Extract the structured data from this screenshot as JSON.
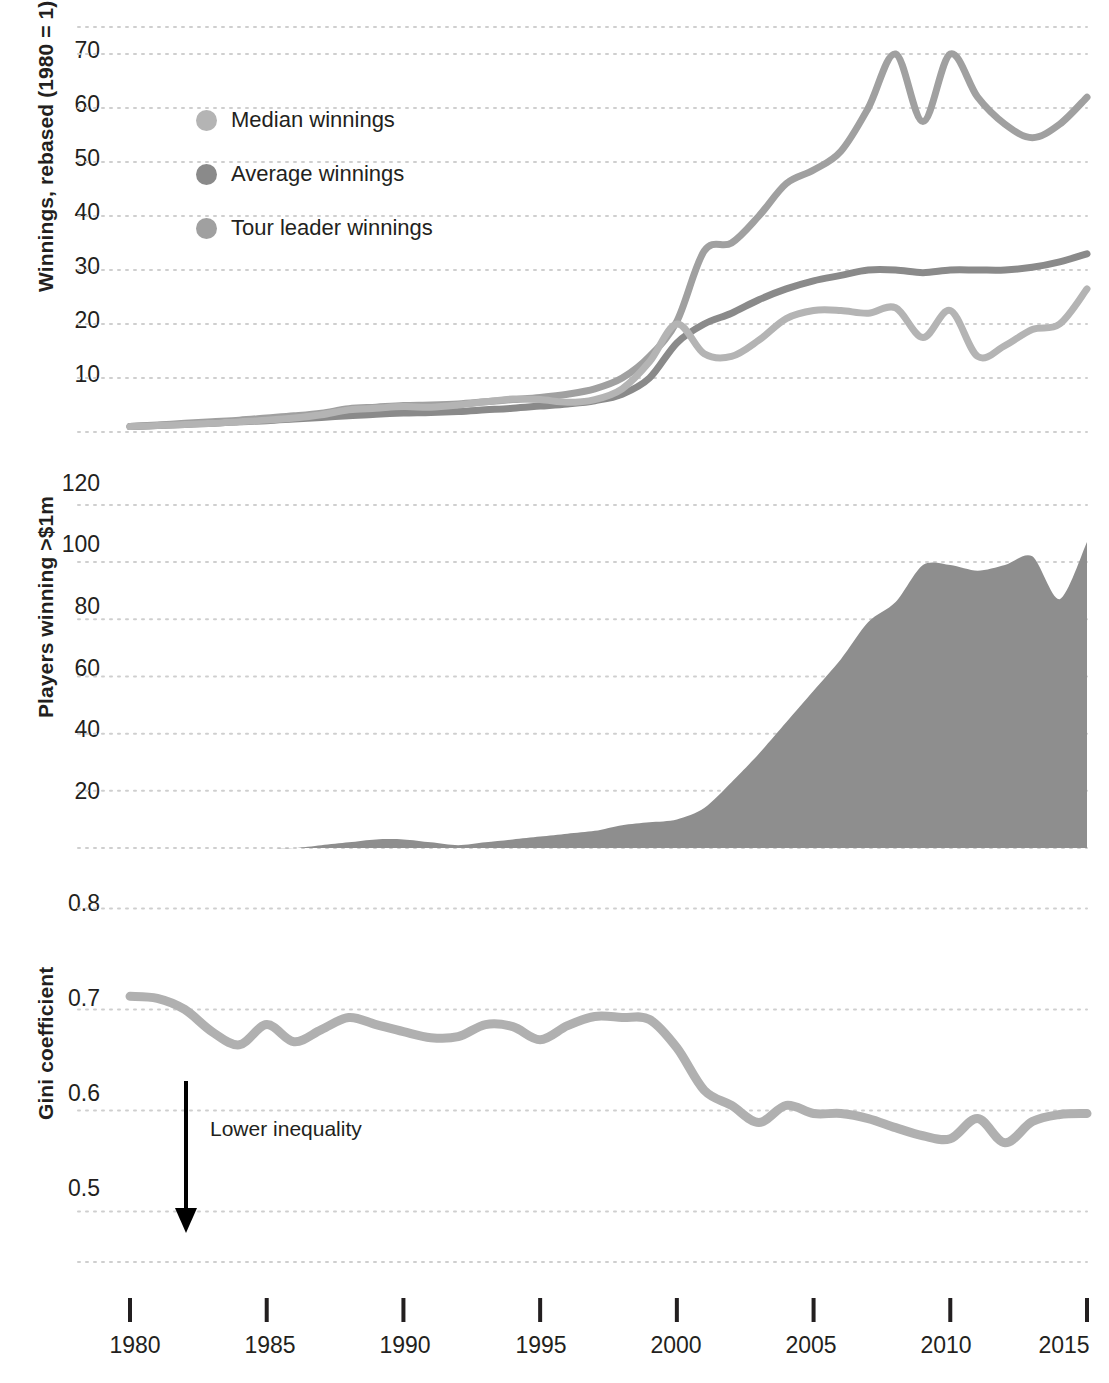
{
  "figure": {
    "background": "#ffffff",
    "gridline_color": "#cfcfcf",
    "text_color": "#231f20"
  },
  "legend": {
    "position": "top-left-inside-panel-1",
    "items": [
      {
        "label": "Median winnings",
        "color": "#b4b4b4",
        "icon": "legend-dot-icon"
      },
      {
        "label": "Average winnings",
        "color": "#8a8a8a",
        "icon": "legend-dot-icon"
      },
      {
        "label": "Tour leader winnings",
        "color": "#a0a0a0",
        "icon": "legend-dot-icon"
      }
    ]
  },
  "annotations": [
    {
      "name": "lower-inequality-annotation",
      "text": "Lower inequality",
      "arrow": "down-arrow-icon"
    }
  ],
  "xaxis": {
    "ticks": [
      1980,
      1985,
      1990,
      1995,
      2000,
      2005,
      2010,
      2015
    ],
    "tick_labels": [
      "1980",
      "1985",
      "1990",
      "1995",
      "2000",
      "2005",
      "2010",
      "2015"
    ],
    "min": 1980,
    "max": 2015
  },
  "chart_data": [
    {
      "type": "line",
      "panel": 1,
      "title": "",
      "ylabel": "Winnings, rebased (1980 = 1)",
      "xlabel": "",
      "ylim": [
        0,
        75
      ],
      "yticks": [
        10,
        20,
        30,
        40,
        50,
        60,
        70
      ],
      "ytick_labels": [
        "10",
        "20",
        "30",
        "40",
        "50",
        "60",
        "70"
      ],
      "grid": true,
      "x": [
        1980,
        1981,
        1982,
        1983,
        1984,
        1985,
        1986,
        1987,
        1988,
        1989,
        1990,
        1991,
        1992,
        1993,
        1994,
        1995,
        1996,
        1997,
        1998,
        1999,
        2000,
        2001,
        2002,
        2003,
        2004,
        2005,
        2006,
        2007,
        2008,
        2009,
        2010,
        2011,
        2012,
        2013,
        2014,
        2015
      ],
      "series": [
        {
          "name": "Tour leader winnings",
          "color": "#a0a0a0",
          "values": [
            1,
            1.3,
            1.6,
            1.9,
            2.2,
            2.6,
            3.0,
            3.5,
            4.3,
            4.6,
            4.9,
            5.0,
            5.2,
            5.6,
            6.0,
            6.4,
            7.0,
            8.0,
            10.0,
            14.0,
            20.5,
            33.5,
            35.0,
            40.0,
            46.0,
            48.5,
            52.0,
            60.0,
            70.0,
            57.5,
            70.0,
            62.0,
            57.0,
            54.5,
            57.0,
            62.0
          ]
        },
        {
          "name": "Average winnings",
          "color": "#8a8a8a",
          "values": [
            1,
            1.2,
            1.4,
            1.6,
            1.9,
            2.1,
            2.4,
            2.7,
            3.0,
            3.3,
            3.5,
            3.6,
            3.8,
            4.1,
            4.4,
            4.8,
            5.2,
            5.8,
            7.0,
            10.0,
            16.5,
            20.0,
            22.0,
            24.5,
            26.5,
            28.0,
            29.0,
            30.0,
            30.0,
            29.5,
            30.0,
            30.0,
            30.0,
            30.5,
            31.5,
            33.0
          ]
        },
        {
          "name": "Median winnings",
          "color": "#b4b4b4",
          "values": [
            1,
            1.2,
            1.4,
            1.6,
            1.9,
            2.2,
            2.6,
            3.2,
            4.1,
            4.4,
            4.7,
            4.6,
            5.0,
            5.6,
            6.1,
            6.0,
            5.5,
            6.0,
            8.0,
            13.0,
            20.0,
            14.5,
            14.0,
            17.0,
            21.0,
            22.5,
            22.5,
            22.0,
            23.0,
            17.5,
            22.5,
            14.0,
            16.0,
            19.0,
            20.0,
            26.5
          ]
        }
      ]
    },
    {
      "type": "area",
      "panel": 2,
      "title": "",
      "ylabel": "Players winning >$1m",
      "xlabel": "",
      "ylim": [
        0,
        135
      ],
      "yticks": [
        20,
        40,
        60,
        80,
        100,
        120
      ],
      "ytick_labels": [
        "20",
        "40",
        "60",
        "80",
        "100",
        "120"
      ],
      "grid": true,
      "color": "#8e8e8e",
      "x": [
        1980,
        1981,
        1982,
        1983,
        1984,
        1985,
        1986,
        1987,
        1988,
        1989,
        1990,
        1991,
        1992,
        1993,
        1994,
        1995,
        1996,
        1997,
        1998,
        1999,
        2000,
        2001,
        2002,
        2003,
        2004,
        2005,
        2006,
        2007,
        2008,
        2009,
        2010,
        2011,
        2012,
        2013,
        2014,
        2015
      ],
      "values": [
        0,
        0,
        0,
        0,
        0,
        0,
        0,
        1,
        2,
        3,
        3,
        2,
        1,
        2,
        3,
        4,
        5,
        6,
        8,
        9,
        10,
        14,
        23,
        33,
        44,
        55,
        66,
        79,
        86,
        99,
        99,
        97,
        99,
        102,
        87,
        107
      ]
    },
    {
      "type": "line",
      "panel": 3,
      "title": "",
      "ylabel": "Gini coefficient",
      "xlabel": "",
      "ylim": [
        0.45,
        0.84
      ],
      "yticks": [
        0.5,
        0.6,
        0.7,
        0.8
      ],
      "ytick_labels": [
        "0.5",
        "0.6",
        "0.7",
        "0.8"
      ],
      "grid": true,
      "color": "#b0b0b0",
      "x": [
        1980,
        1981,
        1982,
        1983,
        1984,
        1985,
        1986,
        1987,
        1988,
        1989,
        1990,
        1991,
        1992,
        1993,
        1994,
        1995,
        1996,
        1997,
        1998,
        1999,
        2000,
        2001,
        2002,
        2003,
        2004,
        2005,
        2006,
        2007,
        2008,
        2009,
        2010,
        2011,
        2012,
        2013,
        2014,
        2015
      ],
      "values": [
        0.713,
        0.711,
        0.7,
        0.678,
        0.665,
        0.685,
        0.668,
        0.68,
        0.692,
        0.685,
        0.678,
        0.672,
        0.673,
        0.685,
        0.683,
        0.67,
        0.684,
        0.693,
        0.692,
        0.69,
        0.662,
        0.62,
        0.605,
        0.588,
        0.605,
        0.597,
        0.597,
        0.592,
        0.583,
        0.575,
        0.572,
        0.592,
        0.568,
        0.589,
        0.596,
        0.597
      ]
    }
  ]
}
